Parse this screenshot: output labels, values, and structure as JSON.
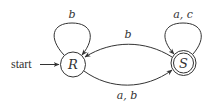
{
  "diagram": {
    "type": "finite-automaton",
    "colors": {
      "stroke": "#333333",
      "background": "#ffffff"
    },
    "start_label": "start",
    "states": [
      {
        "id": "R",
        "label": "R",
        "initial": true,
        "accepting": false
      },
      {
        "id": "S",
        "label": "S",
        "initial": false,
        "accepting": true
      }
    ],
    "transitions": [
      {
        "from": "R",
        "to": "R",
        "label": "b"
      },
      {
        "from": "S",
        "to": "S",
        "label": "a, c"
      },
      {
        "from": "S",
        "to": "R",
        "label": "b"
      },
      {
        "from": "R",
        "to": "S",
        "label": "a, b"
      }
    ]
  }
}
